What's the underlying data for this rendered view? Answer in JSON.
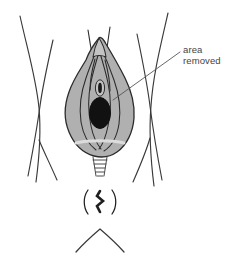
{
  "figure": {
    "type": "medical-line-diagram",
    "background_color": "#ffffff"
  },
  "annotation": {
    "label_line_1": "area",
    "label_line_2": "removed",
    "text_color": "#444444",
    "leader_line_color": "#55555f",
    "leader_from": [
      180,
      52
    ],
    "leader_to": [
      113,
      100
    ]
  },
  "palette": {
    "outline": "#2b2b2b",
    "shaded_fill": "#b0b0b0",
    "shaded_fill_light": "#c4c4c4",
    "dark_opening": "#111111",
    "thigh_line": "#3a3a3a"
  },
  "parts": {
    "shaded_region": "vulva-shaded-area",
    "dark_opening": "vaginal-opening",
    "small_opening": "urethral-opening",
    "hood": "clitoral-hood",
    "fringe": "perineal-fringe",
    "anus": "anus-marking",
    "chevron": "coccyx-chevron",
    "left_thigh": "left-thigh-crease",
    "right_thigh": "right-thigh-crease"
  }
}
